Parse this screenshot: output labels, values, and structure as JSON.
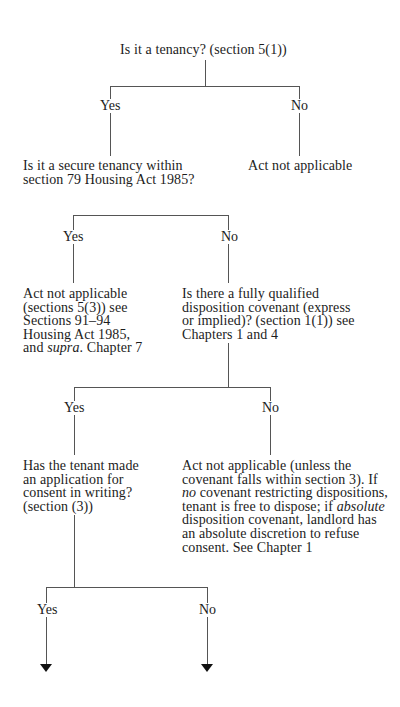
{
  "flowchart": {
    "root": {
      "text": "Is it a tenancy? (section 5(1))"
    },
    "level1": {
      "yes_label": "Yes",
      "no_label": "No",
      "yes_node": [
        "Is it a secure tenancy within",
        "section 79 Housing Act 1985?"
      ],
      "no_node": "Act not applicable"
    },
    "level2": {
      "yes_label": "Yes",
      "no_label": "No",
      "yes_node": [
        "Act not applicable",
        "(sections 5(3)) see",
        "Sections 91–94",
        "Housing Act 1985,",
        "and ",
        "supra",
        ". Chapter 7"
      ],
      "no_node": [
        "Is there a fully qualified",
        "disposition covenant (express",
        "or implied)? (section 1(1)) see",
        "Chapters 1 and 4"
      ]
    },
    "level3": {
      "yes_label": "Yes",
      "no_label": "No",
      "yes_node": [
        "Has the tenant made",
        "an application for",
        "consent in writing?",
        "(section (3))"
      ],
      "no_node": {
        "line1": "Act not applicable (unless the",
        "line2": "covenant falls within section 3). If",
        "line3_italic": "no",
        "line3_rest": " covenant restricting dispositions,",
        "line4_start": "tenant is free to dispose; if ",
        "line4_italic": "absolute",
        "line5": "disposition covenant, landlord has",
        "line6": "an absolute discretion to refuse",
        "line7": "consent. See Chapter 1"
      }
    },
    "level4": {
      "yes_label": "Yes",
      "no_label": "No"
    },
    "colors": {
      "line": "#555555",
      "text": "#1c1c1c",
      "arrow": "#111111"
    }
  }
}
